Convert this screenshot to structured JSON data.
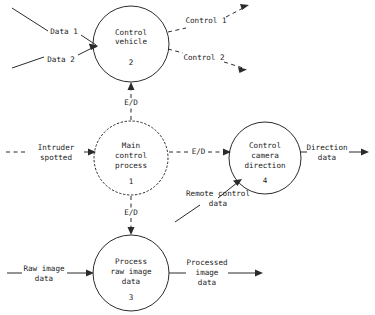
{
  "diagram": {
    "type": "data-flow-diagram",
    "title": "",
    "background_color": "#ffffff",
    "line_color": "#2b2b2b",
    "text_color": "#1a1a1a",
    "processes": [
      {
        "id": "p2",
        "number": "2",
        "label_lines": [
          "Control",
          "vehicle"
        ],
        "line1": "Control",
        "line2": "vehicle",
        "line3": "",
        "border": "solid",
        "cx": 131,
        "cy": 44,
        "r": 38
      },
      {
        "id": "p1",
        "number": "1",
        "label_lines": [
          "Main",
          "control",
          "process"
        ],
        "line1": "Main",
        "line2": "control",
        "line3": "process",
        "border": "dotted",
        "cx": 131,
        "cy": 158,
        "r": 37
      },
      {
        "id": "p4",
        "number": "4",
        "label_lines": [
          "Control",
          "camera",
          "direction"
        ],
        "line1": "Control",
        "line2": "camera",
        "line3": "direction",
        "border": "solid",
        "cx": 265,
        "cy": 158,
        "r": 36
      },
      {
        "id": "p3",
        "number": "3",
        "label_lines": [
          "Process",
          "raw image",
          "data"
        ],
        "line1": "Process",
        "line2": "raw image",
        "line3": "data",
        "border": "solid",
        "cx": 131,
        "cy": 273,
        "r": 38
      }
    ],
    "flows": [
      {
        "id": "f-data1",
        "label_line1": "Data 1",
        "label_line2": "",
        "style": "solid",
        "direction": "into-process-2"
      },
      {
        "id": "f-data2",
        "label_line1": "Data 2",
        "label_line2": "",
        "style": "solid",
        "direction": "into-process-2"
      },
      {
        "id": "f-control1",
        "label_line1": "Control 1",
        "label_line2": "",
        "style": "dashed",
        "direction": "out-of-process-2"
      },
      {
        "id": "f-control2",
        "label_line1": "Control 2",
        "label_line2": "",
        "style": "dashed",
        "direction": "out-of-process-2"
      },
      {
        "id": "f-ed-top",
        "label_line1": "E/D",
        "label_line2": "",
        "style": "dashed",
        "direction": "process-1-to-process-2"
      },
      {
        "id": "f-ed-bottom",
        "label_line1": "E/D",
        "label_line2": "",
        "style": "dashed",
        "direction": "process-1-to-process-3"
      },
      {
        "id": "f-ed-mid",
        "label_line1": "E/D",
        "label_line2": "",
        "style": "dashed",
        "direction": "process-1-to-process-4"
      },
      {
        "id": "f-intruder",
        "label_line1": "Intruder",
        "label_line2": "spotted",
        "style": "dashed",
        "direction": "into-process-1"
      },
      {
        "id": "f-direction",
        "label_line1": "Direction",
        "label_line2": "data",
        "style": "solid",
        "direction": "out-of-process-4"
      },
      {
        "id": "f-remote",
        "label_line1": "Remote control",
        "label_line2": "data",
        "style": "solid",
        "direction": "into-process-4"
      },
      {
        "id": "f-raw",
        "label_line1": "Raw image",
        "label_line2": "data",
        "style": "solid",
        "direction": "into-process-3"
      },
      {
        "id": "f-processed",
        "label_line1": "Processed",
        "label_line2": "image",
        "label_line3": "data",
        "style": "solid",
        "direction": "out-of-process-3"
      }
    ]
  }
}
